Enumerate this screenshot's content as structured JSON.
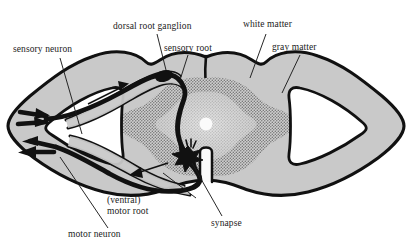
{
  "figure": {
    "background_color": "#ffffff",
    "ink_color": "#1b1b1b",
    "white_matter_fill": "#c9c9c9",
    "gray_matter_fill": "#b4b4b4",
    "gray_matter_texture": "stipple dots",
    "interior_white": "#ffffff",
    "nerve_color": "#111111"
  },
  "labels": {
    "sensory_neuron": "sensory neuron",
    "dorsal_root_ganglion": "dorsal root ganglion",
    "sensory_root": "sensory root",
    "white_matter": "white matter",
    "gray_matter": "gray matter",
    "motor_root_line1": "(ventral)",
    "motor_root_line2": "motor root",
    "motor_neuron": "motor neuron",
    "synapse": "synapse"
  },
  "structures": {
    "spinal_cord": "spinal-cord-cross-section",
    "central_canal": "central-canal",
    "dorsal_median_sulcus": "dorsal-median-sulcus",
    "ventral_median_fissure": "ventral-median-fissure",
    "ganglion_swelling": "dorsal-root-ganglion-swelling",
    "synapse_burst": "synapse-starburst",
    "left_white_wedge": "left-lateral-white-wedge",
    "right_white_wedge": "right-lateral-white-wedge",
    "peripheral_nerve_branches": "peripheral-nerve-branches",
    "sensory_arrow_count": 2,
    "motor_arrow_count": 1
  }
}
